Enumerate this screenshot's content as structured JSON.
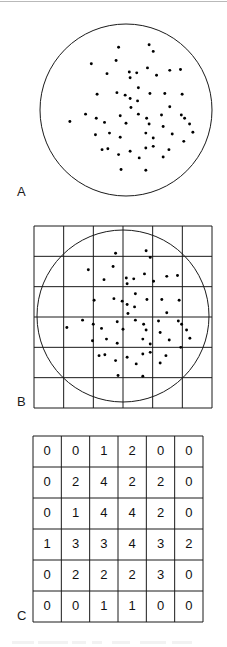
{
  "figure": {
    "panels": [
      {
        "id": "A",
        "label": "A",
        "caption": "Point pattern within circular study region",
        "type": "scatter-in-circle"
      },
      {
        "id": "B",
        "label": "B",
        "caption": "Same point pattern with 6 by 6 quadrat grid overlaid",
        "type": "scatter-with-grid"
      },
      {
        "id": "C",
        "label": "C",
        "caption": "Quadrat counts table",
        "type": "table"
      }
    ]
  },
  "chart_data": [
    {
      "type": "scatter",
      "panel": "A",
      "title": "A",
      "xlabel": "",
      "ylabel": "",
      "xlim": [
        0,
        100
      ],
      "ylim": [
        0,
        100
      ],
      "grid": false,
      "region": {
        "shape": "circle",
        "center_x": 50,
        "center_y": 50,
        "radius": 48,
        "stroke": "#1a1a1a"
      },
      "n_points": 64,
      "marker_color": "#000000",
      "points": [
        [
          45.5,
          88.0
        ],
        [
          64.0,
          89.5
        ],
        [
          66.5,
          85.5
        ],
        [
          29.0,
          78.0
        ],
        [
          44.0,
          80.0
        ],
        [
          52.0,
          73.0
        ],
        [
          56.5,
          72.5
        ],
        [
          52.5,
          69.5
        ],
        [
          38.5,
          72.0
        ],
        [
          63.0,
          75.5
        ],
        [
          68.5,
          71.0
        ],
        [
          76.5,
          74.0
        ],
        [
          83.0,
          74.5
        ],
        [
          57.5,
          63.5
        ],
        [
          32.5,
          59.5
        ],
        [
          44.5,
          60.5
        ],
        [
          49.5,
          59.0
        ],
        [
          52.5,
          57.0
        ],
        [
          57.0,
          55.5
        ],
        [
          64.5,
          60.0
        ],
        [
          73.5,
          60.0
        ],
        [
          84.0,
          59.5
        ],
        [
          53.0,
          51.5
        ],
        [
          76.5,
          52.0
        ],
        [
          25.5,
          47.5
        ],
        [
          32.0,
          45.0
        ],
        [
          46.5,
          46.5
        ],
        [
          57.5,
          47.5
        ],
        [
          62.5,
          45.0
        ],
        [
          71.5,
          47.0
        ],
        [
          83.5,
          47.0
        ],
        [
          85.5,
          45.0
        ],
        [
          16.0,
          43.0
        ],
        [
          37.0,
          42.5
        ],
        [
          50.0,
          42.0
        ],
        [
          64.0,
          41.5
        ],
        [
          72.5,
          40.0
        ],
        [
          88.5,
          41.5
        ],
        [
          90.5,
          36.5
        ],
        [
          40.0,
          36.0
        ],
        [
          31.5,
          35.0
        ],
        [
          46.5,
          33.5
        ],
        [
          62.0,
          36.0
        ],
        [
          66.5,
          33.0
        ],
        [
          78.0,
          35.5
        ],
        [
          85.0,
          31.0
        ],
        [
          35.5,
          26.0
        ],
        [
          39.0,
          26.5
        ],
        [
          45.5,
          23.0
        ],
        [
          52.5,
          25.0
        ],
        [
          62.0,
          27.0
        ],
        [
          66.5,
          28.0
        ],
        [
          76.0,
          26.0
        ],
        [
          58.0,
          21.0
        ],
        [
          72.5,
          21.5
        ],
        [
          47.0,
          14.0
        ],
        [
          62.0,
          13.5
        ]
      ]
    },
    {
      "type": "scatter",
      "panel": "B",
      "title": "B",
      "xlabel": "",
      "ylabel": "",
      "xlim": [
        0,
        100
      ],
      "ylim": [
        0,
        100
      ],
      "grid": true,
      "grid_rows": 6,
      "grid_cols": 6,
      "grid_color": "#1a1a1a",
      "region": {
        "shape": "circle",
        "center_x": 50,
        "center_y": 50,
        "radius": 48,
        "stroke": "#1a1a1a"
      },
      "n_points": 64,
      "marker_color": "#000000",
      "note": "Identical point pattern to panel A with quadrat grid superimposed"
    },
    {
      "type": "table",
      "panel": "C",
      "title": "C",
      "rows": 6,
      "cols": 6,
      "xlabel": "",
      "ylabel": "",
      "values": [
        [
          0,
          0,
          1,
          2,
          0,
          0
        ],
        [
          0,
          2,
          4,
          2,
          2,
          0
        ],
        [
          0,
          1,
          4,
          4,
          2,
          0
        ],
        [
          1,
          3,
          3,
          4,
          3,
          2
        ],
        [
          0,
          2,
          2,
          2,
          3,
          0
        ],
        [
          0,
          0,
          1,
          1,
          0,
          0
        ]
      ],
      "total": 45,
      "cell_border_color": "#1a1a1a",
      "text_color": "#111111"
    }
  ],
  "colors": {
    "ink": "#1a1a1a",
    "dot": "#000000",
    "page": "#ffffff",
    "rule": "#b9b9b9",
    "ghost_text": "#e8e8e8"
  }
}
